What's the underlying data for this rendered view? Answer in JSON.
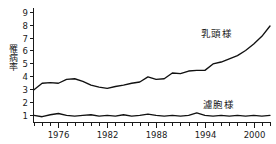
{
  "chart_data": {
    "type": "line",
    "title": "",
    "xlabel": "",
    "ylabel": "罹病率",
    "xlim": [
      1973,
      2002
    ],
    "ylim": [
      0.4,
      9.3
    ],
    "yticks": [
      1,
      2,
      3,
      4,
      5,
      6,
      7,
      8,
      9
    ],
    "ytick_labels": [
      "1",
      "2",
      "3",
      "4",
      "5",
      "6",
      "7",
      "8",
      "9"
    ],
    "xticks": [
      1976,
      1982,
      1988,
      1994,
      2000
    ],
    "xtick_labels": [
      "1976",
      "1982",
      "1988",
      "1994",
      "2000"
    ],
    "minor_xtick_interval": 1,
    "grid": false,
    "legend_position": "inline-annotation",
    "x": [
      1973,
      1974,
      1975,
      1976,
      1977,
      1978,
      1979,
      1980,
      1981,
      1982,
      1983,
      1984,
      1985,
      1986,
      1987,
      1988,
      1989,
      1990,
      1991,
      1992,
      1993,
      1994,
      1995,
      1996,
      1997,
      1998,
      1999,
      2000,
      2001,
      2002
    ],
    "series": [
      {
        "name": "乳頭様",
        "label": "乳頭様",
        "color": "#111111",
        "values": [
          2.95,
          3.45,
          3.5,
          3.45,
          3.75,
          3.8,
          3.6,
          3.3,
          3.15,
          3.05,
          3.2,
          3.3,
          3.45,
          3.55,
          3.95,
          3.75,
          3.8,
          4.25,
          4.2,
          4.4,
          4.45,
          4.45,
          4.95,
          5.1,
          5.35,
          5.6,
          6.0,
          6.5,
          7.1,
          7.9
        ]
      },
      {
        "name": "濾胞様",
        "label": "濾胞様",
        "color": "#111111",
        "values": [
          0.95,
          0.85,
          1.0,
          1.1,
          0.95,
          0.9,
          0.95,
          1.0,
          0.9,
          0.95,
          0.9,
          1.0,
          0.9,
          0.95,
          1.05,
          0.95,
          0.9,
          0.95,
          0.9,
          0.95,
          1.15,
          0.95,
          0.9,
          0.95,
          0.9,
          0.95,
          0.9,
          0.95,
          0.9,
          0.95
        ]
      }
    ]
  }
}
